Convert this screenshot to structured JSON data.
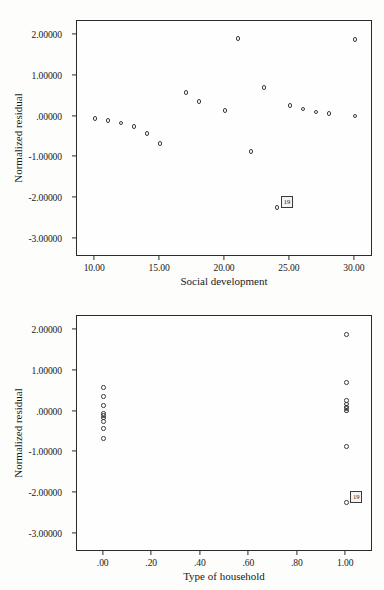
{
  "figure": {
    "background_color": "#fdfdfc",
    "ink_color": "#2b2b2b"
  },
  "chart_data": [
    {
      "id": "residual-vs-social-development",
      "type": "scatter",
      "title": "",
      "xlabel": "Social development",
      "ylabel": "Normalized residual",
      "xlim": [
        8.6,
        31.4
      ],
      "ylim": [
        -3.45,
        2.35
      ],
      "xticks": [
        10,
        15,
        20,
        25,
        30
      ],
      "xtick_labels": [
        "10.00",
        "15.00",
        "20.00",
        "25.00",
        "30.00"
      ],
      "yticks": [
        2,
        1,
        0,
        -1,
        -2,
        -3
      ],
      "ytick_labels": [
        "2.00000",
        "1.00000",
        ".00000",
        "-1.00000",
        "-2.00000",
        "-3.00000"
      ],
      "grid": false,
      "legend": null,
      "marker": "open-circle",
      "points": [
        {
          "x": 10.0,
          "y": -0.05
        },
        {
          "x": 11.0,
          "y": -0.1
        },
        {
          "x": 12.0,
          "y": -0.16
        },
        {
          "x": 13.0,
          "y": -0.25
        },
        {
          "x": 14.0,
          "y": -0.41
        },
        {
          "x": 15.0,
          "y": -0.66
        },
        {
          "x": 17.0,
          "y": 0.6
        },
        {
          "x": 18.0,
          "y": 0.37
        },
        {
          "x": 20.0,
          "y": 0.15
        },
        {
          "x": 21.0,
          "y": 1.92
        },
        {
          "x": 22.0,
          "y": -0.86
        },
        {
          "x": 23.0,
          "y": 0.72
        },
        {
          "x": 24.0,
          "y": -2.24
        },
        {
          "x": 25.0,
          "y": 0.27
        },
        {
          "x": 26.0,
          "y": 0.19
        },
        {
          "x": 27.0,
          "y": 0.11
        },
        {
          "x": 28.0,
          "y": 0.08
        },
        {
          "x": 30.0,
          "y": 0.02
        },
        {
          "x": 30.0,
          "y": 1.9
        }
      ],
      "annotations": [
        {
          "label": "19",
          "x": 24.0,
          "y": -2.24,
          "style": "boxed-case-number"
        }
      ]
    },
    {
      "id": "residual-vs-type-of-household",
      "type": "scatter",
      "title": "",
      "xlabel": "Type of household",
      "ylabel": "Normalized residual",
      "xlim": [
        -0.11,
        1.11
      ],
      "ylim": [
        -3.45,
        2.35
      ],
      "xticks": [
        0.0,
        0.2,
        0.4,
        0.6,
        0.8,
        1.0
      ],
      "xtick_labels": [
        ".00",
        ".20",
        ".40",
        ".60",
        ".80",
        "1.00"
      ],
      "yticks": [
        2,
        1,
        0,
        -1,
        -2,
        -3
      ],
      "ytick_labels": [
        "2.00000",
        "1.00000",
        ".00000",
        "-1.00000",
        "-2.00000",
        "-3.00000"
      ],
      "grid": false,
      "legend": null,
      "marker": "open-circle",
      "points": [
        {
          "x": 0.0,
          "y": 0.6
        },
        {
          "x": 0.0,
          "y": 0.37
        },
        {
          "x": 0.0,
          "y": 0.15
        },
        {
          "x": 0.0,
          "y": -0.05
        },
        {
          "x": 0.0,
          "y": -0.1
        },
        {
          "x": 0.0,
          "y": -0.16
        },
        {
          "x": 0.0,
          "y": -0.25
        },
        {
          "x": 0.0,
          "y": -0.41
        },
        {
          "x": 0.0,
          "y": -0.66
        },
        {
          "x": 1.0,
          "y": 1.9
        },
        {
          "x": 1.0,
          "y": 0.72
        },
        {
          "x": 1.0,
          "y": 0.27
        },
        {
          "x": 1.0,
          "y": 0.19
        },
        {
          "x": 1.0,
          "y": 0.11
        },
        {
          "x": 1.0,
          "y": 0.08
        },
        {
          "x": 1.0,
          "y": 0.02
        },
        {
          "x": 1.0,
          "y": -0.86
        },
        {
          "x": 1.0,
          "y": -2.24
        }
      ],
      "annotations": [
        {
          "label": "19",
          "x": 1.0,
          "y": -2.24,
          "style": "boxed-case-number"
        }
      ]
    }
  ]
}
